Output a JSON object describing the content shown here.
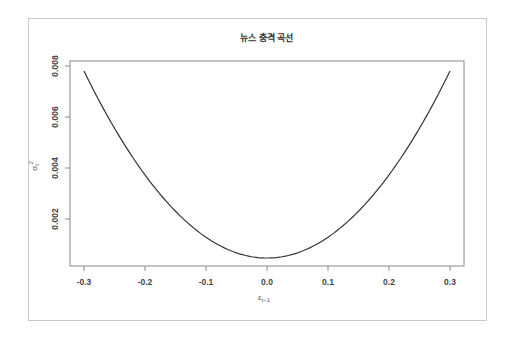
{
  "chart_data": {
    "type": "line",
    "title": "뉴스 충격 곡선",
    "xlabel": "ε_{t-1}",
    "ylabel": "σ_t^2",
    "xlim": [
      -0.3,
      0.3
    ],
    "ylim": [
      0.0003,
      0.008
    ],
    "x_ticks": [
      "-0.3",
      "-0.2",
      "-0.1",
      "0.0",
      "0.1",
      "0.2",
      "0.3"
    ],
    "y_ticks": [
      "0.002",
      "0.004",
      "0.006",
      "0.008"
    ],
    "grid": false,
    "legend": null,
    "series": [
      {
        "name": "news impact curve",
        "x": [
          -0.3,
          -0.25,
          -0.2,
          -0.15,
          -0.1,
          -0.05,
          0.0,
          0.05,
          0.1,
          0.15,
          0.2,
          0.25,
          0.3
        ],
        "values": [
          0.0078,
          0.0056,
          0.0037,
          0.0023,
          0.0013,
          0.00067,
          0.00047,
          0.00067,
          0.0013,
          0.0023,
          0.0037,
          0.0056,
          0.0078
        ]
      }
    ]
  },
  "labels": {
    "title": "뉴스 충격 곡선",
    "xlabel_main": "ε",
    "xlabel_sub": "t−1",
    "ylabel_main": "σ",
    "ylabel_sub": "t",
    "ylabel_sup": "2"
  }
}
